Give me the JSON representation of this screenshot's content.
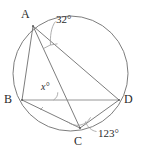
{
  "figure": {
    "kind": "circle-geometry-diagram",
    "width": 142,
    "height": 154,
    "background_color": "#ffffff",
    "stroke_color": "#6e6e6e",
    "text_color": "#2b2b2b"
  },
  "circle": {
    "center_x": 70.5,
    "center_y": 73.5,
    "radius": 57.5
  },
  "vertices": [
    {
      "name": "A",
      "label": "A",
      "x": 33,
      "y": 26,
      "label_x": 21,
      "label_y": 8
    },
    {
      "name": "B",
      "label": "B",
      "x": 22,
      "y": 100,
      "label_x": 4,
      "label_y": 93
    },
    {
      "name": "C",
      "label": "C",
      "x": 80,
      "y": 128,
      "label_x": 74,
      "label_y": 135
    },
    {
      "name": "D",
      "label": "D",
      "x": 119,
      "y": 100,
      "label_x": 124,
      "label_y": 93
    }
  ],
  "chords": [
    {
      "name": "AB",
      "from": "A",
      "to": "B"
    },
    {
      "name": "AC",
      "from": "A",
      "to": "C"
    },
    {
      "name": "AD",
      "from": "A",
      "to": "D"
    },
    {
      "name": "BD",
      "from": "B",
      "to": "D"
    },
    {
      "name": "BC",
      "from": "B",
      "to": "C"
    },
    {
      "name": "CD",
      "from": "C",
      "to": "D"
    }
  ],
  "angles": [
    {
      "name": "angle-at-A",
      "label": "32°",
      "value": 32,
      "at_vertex": "A",
      "between": [
        "AC",
        "AD"
      ],
      "label_x": 56,
      "label_y": 14
    },
    {
      "name": "angle-x",
      "label": "x°",
      "value": null,
      "at_vertex": "intersection-of-AC-and-BD",
      "between": [
        "BD",
        "AC"
      ],
      "label_x": 41,
      "label_y": 82
    },
    {
      "name": "angle-at-C",
      "label": "123°",
      "value": 123,
      "at_vertex": "C",
      "between": [
        "CB",
        "CD"
      ],
      "label_x": 98,
      "label_y": 128
    }
  ]
}
